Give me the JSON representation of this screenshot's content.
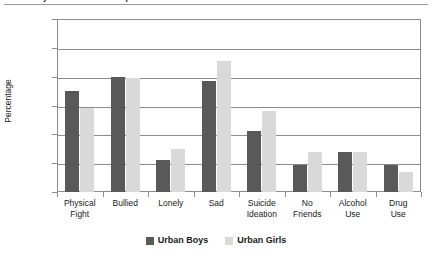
{
  "figure": {
    "title_partial": "Urban Boys and Girls — Comparison of Risk Behaviours and Mental Health Indicators",
    "ylabel": "Percentage"
  },
  "legend": {
    "position": "bottom-center",
    "items": [
      {
        "label": "Urban Boys",
        "color": "#595959",
        "swatch": "legend-swatch"
      },
      {
        "label": "Urban Girls",
        "color": "#d9d9d9",
        "swatch": "legend-swatch"
      }
    ]
  },
  "axis": {
    "yticks": [
      "0",
      "10",
      "20",
      "30",
      "40",
      "50",
      "60"
    ],
    "ymin": 0,
    "ymax": 60,
    "ystep": 10
  },
  "categories_display": [
    {
      "line1": "Physical",
      "line2": "Fight"
    },
    {
      "line1": "Bullied",
      "line2": ""
    },
    {
      "line1": "Lonely",
      "line2": ""
    },
    {
      "line1": "Sad",
      "line2": ""
    },
    {
      "line1": "Suicide",
      "line2": "Ideation"
    },
    {
      "line1": "No",
      "line2": "Friends"
    },
    {
      "line1": "Alcohol",
      "line2": "Use"
    },
    {
      "line1": "Drug",
      "line2": "Use"
    }
  ],
  "chart_data": {
    "type": "bar",
    "title": "Urban Boys and Girls — Comparison of Risk Behaviours and Mental Health Indicators",
    "xlabel": "",
    "ylabel": "Percentage",
    "ylim": [
      0,
      60
    ],
    "ytick_step": 10,
    "grid": true,
    "legend_position": "bottom-center",
    "categories": [
      "Physical Fight",
      "Bullied",
      "Lonely",
      "Sad",
      "Suicide Ideation",
      "No Friends",
      "Alcohol Use",
      "Drug Use"
    ],
    "series": [
      {
        "name": "Urban Boys",
        "color": "#595959",
        "values": [
          35,
          40,
          11,
          38.5,
          21,
          9.5,
          14,
          9.5
        ]
      },
      {
        "name": "Urban Girls",
        "color": "#d9d9d9",
        "values": [
          29,
          39.5,
          15,
          45.5,
          28,
          14,
          14,
          7
        ]
      }
    ]
  }
}
